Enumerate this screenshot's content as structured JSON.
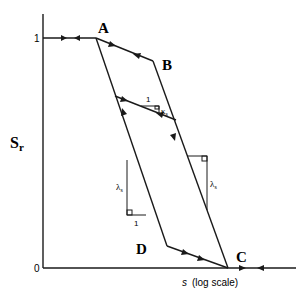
{
  "diagram": {
    "type": "hysteresis",
    "y_axis": {
      "label_main": "S",
      "label_sub": "r",
      "tick_top": "1",
      "tick_bottom": "0"
    },
    "x_axis": {
      "label_var": "s",
      "label_note": "(log scale)"
    },
    "points": {
      "A": "A",
      "B": "B",
      "C": "C",
      "D": "D"
    },
    "slopes": {
      "kappa_label": "κ",
      "kappa_sub": "s",
      "kappa_run": "1",
      "lambda_left_label": "λ",
      "lambda_left_sub": "s",
      "lambda_left_run": "1",
      "lambda_right_label": "λ",
      "lambda_right_sub": "s"
    },
    "colors": {
      "stroke": "#1a1a1a",
      "background": "#ffffff"
    }
  }
}
